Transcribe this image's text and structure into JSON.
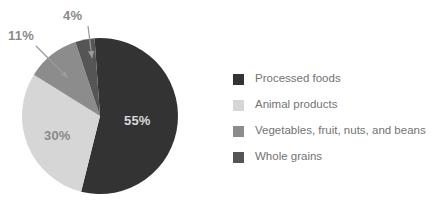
{
  "chart_data": {
    "type": "pie",
    "title": "",
    "categories": [
      "Processed foods",
      "Animal products",
      "Vegetables, fruit, nuts, and beans",
      "Whole grains"
    ],
    "values": [
      55,
      30,
      11,
      4
    ],
    "value_labels": [
      "55%",
      "30%",
      "11%",
      "4%"
    ],
    "units": "percent",
    "colors": [
      "#333333",
      "#d6d6d6",
      "#8c8c8c",
      "#555555"
    ],
    "legend_position": "right",
    "grid": false,
    "start_angle_deg": 356,
    "direction": "clockwise",
    "inside_labels": [
      {
        "text": "55%",
        "color": "#d9d9d9",
        "x": 124,
        "y": 125
      },
      {
        "text": "30%",
        "color": "#8a8a8a",
        "x": 44,
        "y": 140
      }
    ],
    "callouts": [
      {
        "text": "11%",
        "x": 8,
        "y": 40,
        "line_from_x": 36,
        "line_from_y": 46,
        "line_to_x": 68,
        "line_to_y": 78
      },
      {
        "text": "4%",
        "x": 63,
        "y": 20,
        "line_from_x": 88,
        "line_from_y": 26,
        "line_to_x": 92,
        "line_to_y": 58
      }
    ]
  },
  "legend": {
    "items": [
      {
        "label": "Processed foods",
        "color": "#333333"
      },
      {
        "label": "Animal products",
        "color": "#d6d6d6"
      },
      {
        "label": "Vegetables, fruit, nuts, and beans",
        "color": "#8c8c8c"
      },
      {
        "label": "Whole grains",
        "color": "#555555"
      }
    ]
  }
}
